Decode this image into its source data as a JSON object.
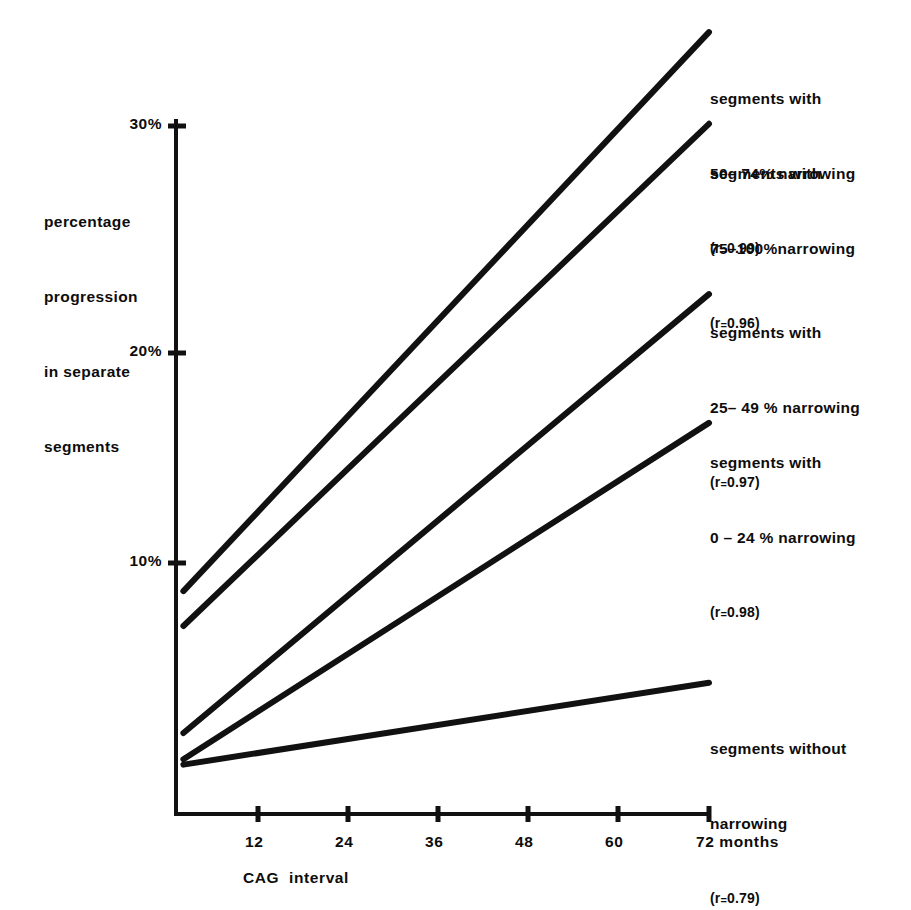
{
  "chart_data": {
    "type": "line",
    "title": "",
    "xlabel": "CAG  interval",
    "ylabel": "percentage\nprogression\nin separate\nsegments",
    "x_unit_label": "months",
    "xlim": [
      0,
      72
    ],
    "ylim": [
      0,
      31
    ],
    "grid": false,
    "legend_position": "right-inline",
    "x_ticks": [
      {
        "value": 12,
        "label": "12"
      },
      {
        "value": 24,
        "label": "24"
      },
      {
        "value": 36,
        "label": "36"
      },
      {
        "value": 48,
        "label": "48"
      },
      {
        "value": 60,
        "label": "60"
      },
      {
        "value": 72,
        "label": "72 months"
      }
    ],
    "y_ticks": [
      {
        "value": 10,
        "label": "10%"
      },
      {
        "value": 20,
        "label": "20%"
      },
      {
        "value": 30,
        "label": "30%"
      }
    ],
    "series": [
      {
        "name": "segments with 50-74% narrowing",
        "label_lines": [
          "segments with",
          "50– 74% narrowing",
          "(r₂0.99)"
        ],
        "label_line1": "segments with",
        "label_line2": "50– 74% narrowing",
        "label_r_prefix": "(r",
        "label_r_sub": "=",
        "label_r_value": "0.99)",
        "correlation": 0.99,
        "x": [
          1,
          72
        ],
        "y": [
          8.7,
          34.3
        ],
        "color": "#111111"
      },
      {
        "name": "segments with 75-100% narrowing",
        "label_line1": "segments with",
        "label_line2": "75–100%narrowing",
        "label_r_prefix": "(r",
        "label_r_sub": "=",
        "label_r_value": "0.96)",
        "correlation": 0.96,
        "x": [
          1,
          72
        ],
        "y": [
          7.1,
          30.1
        ],
        "color": "#111111"
      },
      {
        "name": "segments with 25-49% narrowing",
        "label_line1": "segments with",
        "label_line2": "25– 49 % narrowing",
        "label_r_prefix": "(r",
        "label_r_sub": "=",
        "label_r_value": "0.97)",
        "correlation": 0.97,
        "x": [
          1,
          72
        ],
        "y": [
          2.2,
          22.3
        ],
        "color": "#111111"
      },
      {
        "name": "segments with 0-24% narrowing",
        "label_line1": "segments with",
        "label_line2": "0 – 24 % narrowing",
        "label_r_prefix": "(r",
        "label_r_sub": "=",
        "label_r_value": "0.98)",
        "correlation": 0.98,
        "x": [
          1,
          72
        ],
        "y": [
          1.0,
          16.4
        ],
        "color": "#111111"
      },
      {
        "name": "segments without narrowing",
        "label_line1": "segments without",
        "label_line2": "narrowing",
        "label_r_prefix": "(r",
        "label_r_sub": "=",
        "label_r_value": "0.79)",
        "correlation": 0.79,
        "x": [
          1,
          72
        ],
        "y": [
          0.75,
          4.5
        ],
        "color": "#111111"
      }
    ]
  },
  "axis": {
    "y_label_l1": "percentage",
    "y_label_l2": "progression",
    "y_label_l3": "in separate",
    "y_label_l4": "segments",
    "y_tick_30": "30%",
    "y_tick_20": "20%",
    "y_tick_10": "10%",
    "x_tick_12": "12",
    "x_tick_24": "24",
    "x_tick_36": "36",
    "x_tick_48": "48",
    "x_tick_60": "60",
    "x_tick_72": "72 months",
    "x_title": "CAG  interval"
  }
}
